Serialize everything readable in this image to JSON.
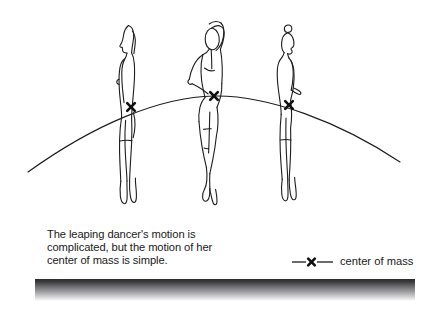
{
  "figure": {
    "background_color": "#ffffff",
    "line_color": "#1d1d1d",
    "caption": "The leaping dancer's motion is\ncomplicated, but the motion of her\ncenter of mass is simple."
  },
  "legend": {
    "label": "center of mass",
    "marker": "x-marker",
    "line_color": "#1d1d1d"
  },
  "figures": [
    {
      "name": "dancer-left",
      "pose": "side profile, arms down, facing left",
      "center_of_mass": {
        "x": 131,
        "y": 107,
        "marker": "x-marker"
      }
    },
    {
      "name": "dancer-middle",
      "pose": "front view, one arm overhead, one hand on hip",
      "center_of_mass": {
        "x": 214,
        "y": 96,
        "marker": "x-marker"
      }
    },
    {
      "name": "dancer-right",
      "pose": "side profile, arms down, facing right, hair in bun",
      "center_of_mass": {
        "x": 289,
        "y": 105,
        "marker": "x-marker"
      }
    }
  ],
  "trajectory": {
    "name": "center-of-mass-parabola",
    "description": "smooth parabolic arc through all three center of mass marks",
    "start": {
      "x": 28,
      "y": 172
    },
    "apex": {
      "x": 214,
      "y": 96
    },
    "end": {
      "x": 400,
      "y": 162
    }
  },
  "ground": {
    "name": "floor-gradient-bar",
    "left": 35,
    "right": 415,
    "top": 279,
    "bottom": 301,
    "top_color": "#2b2b2e",
    "bottom_color": "#ffffff"
  }
}
